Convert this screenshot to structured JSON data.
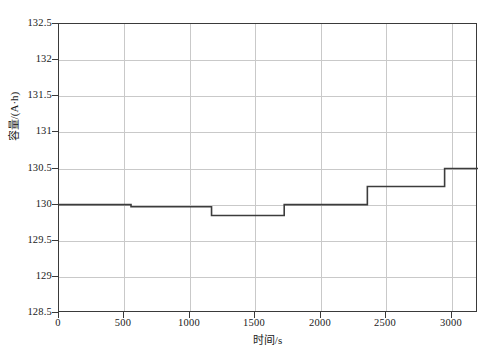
{
  "chart_data": {
    "type": "line",
    "title": "",
    "subtitle": "",
    "xlabel": "时间/s",
    "ylabel": "容量/(A·h)",
    "xlim": [
      0,
      3200
    ],
    "ylim": [
      128.5,
      132.5
    ],
    "grid": true,
    "legend": null,
    "legend_position": "none",
    "x_ticks": [
      0,
      500,
      1000,
      1500,
      2000,
      2500,
      3000
    ],
    "x_tick_labels": [
      "0",
      "500",
      "1000",
      "1500",
      "2000",
      "2500",
      "3000"
    ],
    "y_ticks": [
      128.5,
      129,
      129.5,
      130,
      130.5,
      131,
      131.5,
      132,
      132.5
    ],
    "y_tick_labels": [
      "128.5",
      "129",
      "129.5",
      "130",
      "130.5",
      "131",
      "131.5",
      "132",
      "132.5"
    ],
    "series": [
      {
        "name": "容量",
        "style": "step",
        "color": "#3c3c3c",
        "x": [
          0,
          550,
          550,
          1165,
          1165,
          1720,
          1720,
          2355,
          2355,
          2945,
          2945,
          3200
        ],
        "y": [
          130.0,
          130.0,
          129.97,
          129.97,
          129.85,
          129.85,
          130.0,
          130.0,
          130.25,
          130.25,
          130.5,
          130.5
        ]
      }
    ],
    "steps": [
      {
        "x_start": 0,
        "x_end": 550,
        "value": 130.0
      },
      {
        "x_start": 550,
        "x_end": 1165,
        "value": 129.97
      },
      {
        "x_start": 1165,
        "x_end": 1720,
        "value": 129.85
      },
      {
        "x_start": 1720,
        "x_end": 2355,
        "value": 130.0
      },
      {
        "x_start": 2355,
        "x_end": 2945,
        "value": 130.25
      },
      {
        "x_start": 2945,
        "x_end": 3200,
        "value": 130.5
      }
    ]
  },
  "axes": {
    "frame_color": "#3a3a3a",
    "grid_color": "#c9c9c9",
    "background": "#ffffff"
  }
}
